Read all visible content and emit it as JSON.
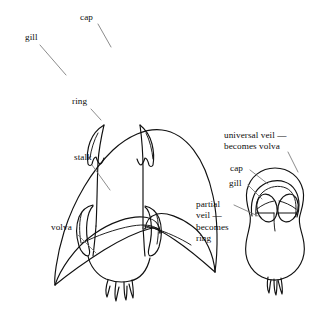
{
  "figure": {
    "background_color": "#ffffff",
    "line_color": "#111111",
    "leader_color": "#6f6f6f"
  },
  "mature_mushroom": {
    "name": "mature mushroom",
    "labels": {
      "cap": "cap",
      "gill": "gill",
      "ring": "ring",
      "stalk": "stalk",
      "volva": "volva"
    }
  },
  "button_mushroom": {
    "name": "button stage mushroom",
    "labels": {
      "universal_veil": "universal veil —\nbecomes volva",
      "cap": "cap",
      "gill": "gill",
      "partial_veil": "partial\nveil —\nbecomes\nring"
    }
  }
}
